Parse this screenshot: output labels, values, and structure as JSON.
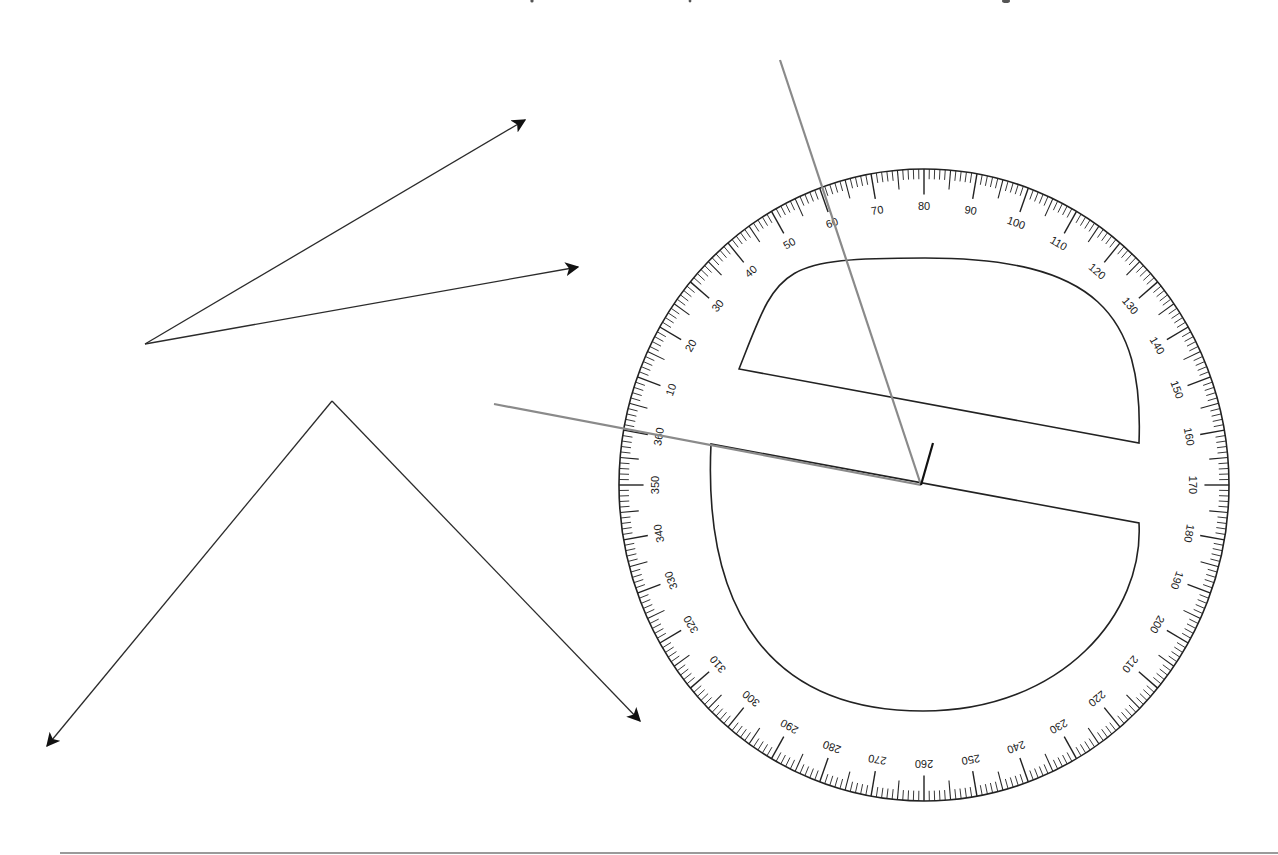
{
  "diagram": {
    "colors": {
      "ray": "#2b2b2b",
      "guide_line": "#8a8a8a",
      "protractor_ink": "#222222",
      "background": "#ffffff"
    },
    "angles": [
      {
        "name": "angle-1",
        "vertex": [
          145,
          344
        ],
        "rays": [
          {
            "tip": [
              525,
              120
            ]
          },
          {
            "tip": [
              578,
              267
            ]
          }
        ]
      },
      {
        "name": "angle-2",
        "vertex": [
          332,
          401
        ],
        "rays": [
          {
            "tip": [
              47,
              746
            ]
          },
          {
            "tip": [
              640,
              721
            ]
          }
        ]
      }
    ],
    "guide_lines": [
      {
        "name": "guide-line-baseline",
        "from": [
          494,
          404
        ],
        "to": [
          921,
          485
        ]
      },
      {
        "name": "guide-line-steep",
        "from": [
          780,
          60
        ],
        "to": [
          921,
          485
        ]
      }
    ],
    "protractor": {
      "center": [
        924,
        485
      ],
      "rx": 305,
      "ry": 316,
      "label_step": 10,
      "major_every": 10,
      "medium_every": 5,
      "minor_every": 1,
      "zero_offset_deg": 170,
      "labels": [
        "10",
        "20",
        "30",
        "40",
        "50",
        "60",
        "70",
        "80",
        "90",
        "100",
        "110",
        "120",
        "130",
        "140",
        "150",
        "160",
        "170",
        "180",
        "190",
        "200",
        "210",
        "220",
        "230",
        "240",
        "250",
        "260",
        "270",
        "280",
        "290",
        "300",
        "310",
        "320",
        "330",
        "340",
        "350",
        "360"
      ],
      "vertex_mark": {
        "from": [
          921,
          485
        ],
        "to": [
          933,
          443
        ]
      },
      "upper_cutout": {
        "chord_left": [
          739,
          369
        ],
        "chord_right": [
          1139,
          443
        ],
        "arc_top": [
          925,
          258
        ]
      },
      "lower_cutout": {
        "chord_left": [
          711,
          444
        ],
        "chord_right": [
          1139,
          523
        ],
        "arc_bottom": [
          923,
          711
        ]
      }
    },
    "footer_rule": {
      "y": 853,
      "x_start": 60,
      "x_end": 1278
    }
  }
}
